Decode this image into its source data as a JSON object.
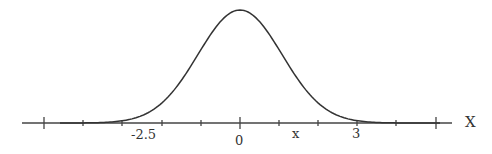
{
  "chart_data": {
    "type": "line",
    "title": "",
    "xlabel": "X",
    "ylabel": "",
    "x_tick_labels": [
      {
        "label": "-2.5",
        "position": "third tick left of 0"
      },
      {
        "label": "0",
        "position": "center"
      },
      {
        "label": "x",
        "position": "between 0 and 3"
      },
      {
        "label": "3",
        "position": "third tick right of 0"
      }
    ],
    "tick_count": 11,
    "major_ticks": [
      "left end",
      "0",
      "right end"
    ],
    "curve": {
      "mean": 0,
      "peak_x": 0,
      "shape": "normal distribution"
    },
    "grid": false,
    "legend": false
  },
  "labels": {
    "neg25": "-2.5",
    "zero": "0",
    "x": "x",
    "three": "3",
    "axis": "X"
  }
}
